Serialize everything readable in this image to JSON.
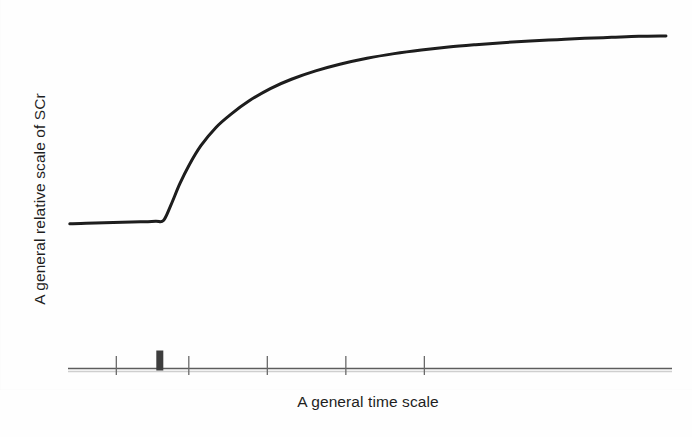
{
  "figure": {
    "background_color": "#fefefe",
    "ink_color": "#1b1b1b",
    "axis_color": "#5a5a5a",
    "event_marker_color": "#3a3a3a"
  },
  "axes": {
    "x_title": "A general time scale",
    "y_title": "A general relative scale of SCr",
    "x_tick_labels": [],
    "y_tick_labels": []
  },
  "chart_data": {
    "type": "line",
    "title": "",
    "subtitle": "",
    "xlabel": "A general time scale",
    "ylabel": "A general relative scale of SCr",
    "xlim": [
      0,
      10
    ],
    "ylim": [
      0,
      10
    ],
    "grid": false,
    "legend": null,
    "legend_position": "none",
    "x_ticks": [
      0.8,
      2.0,
      3.3,
      4.6,
      5.9
    ],
    "y_ticks": [],
    "axis_note": "Only an unlabeled x-axis baseline with five small tick marks is drawn; no y-axis spine and no numeric tick labels are printed.",
    "annotations": [
      {
        "name": "event-marker",
        "type": "vertical-bar",
        "x": 1.52,
        "label": "",
        "description": "Thick short bold vertical bar on the x-axis baseline marking the insult/event time, aligned with the upward break of the curve."
      }
    ],
    "series": [
      {
        "name": "SCr",
        "style": "solid",
        "color": "#1b1b1b",
        "linewidth": 3,
        "description": "Flat stable baseline, then an abrupt steep linear rise beginning at the event marker, which decelerates into a concave-down curve approaching a new higher plateau.",
        "x": [
          0.03,
          0.3,
          0.6,
          0.9,
          1.2,
          1.45,
          1.58,
          1.7,
          1.85,
          2.0,
          2.2,
          2.45,
          2.7,
          3.0,
          3.35,
          3.7,
          4.1,
          4.5,
          4.95,
          5.4,
          5.85,
          6.3,
          6.75,
          7.2,
          7.65,
          8.1,
          8.55,
          9.0,
          9.45,
          9.9
        ],
        "y": [
          4.35,
          4.37,
          4.38,
          4.4,
          4.41,
          4.43,
          4.45,
          4.9,
          5.55,
          6.1,
          6.7,
          7.25,
          7.65,
          8.05,
          8.42,
          8.7,
          8.95,
          9.15,
          9.33,
          9.47,
          9.58,
          9.67,
          9.74,
          9.8,
          9.85,
          9.89,
          9.93,
          9.96,
          9.99,
          10.0
        ]
      }
    ]
  }
}
